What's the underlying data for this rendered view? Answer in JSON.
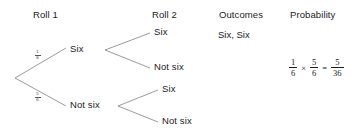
{
  "diagram": {
    "type": "probability-tree",
    "title_row": {
      "roll1": "Roll 1",
      "roll2": "Roll 2",
      "outcomes": "Outcomes",
      "probability": "Probability"
    },
    "roll1_branches": [
      {
        "label": "Six",
        "probability_numerator": "1",
        "probability_denominator": "6"
      },
      {
        "label": "Not six",
        "probability_numerator": "5",
        "probability_denominator": "6"
      }
    ],
    "roll2_branches": [
      {
        "label": "Six"
      },
      {
        "label": "Not six"
      },
      {
        "label": "Six"
      },
      {
        "label": "Not six"
      }
    ],
    "outcomes": [
      {
        "label": "Six, Six"
      }
    ],
    "probability_expression": {
      "factor1": {
        "numerator": "1",
        "denominator": "6"
      },
      "times": "×",
      "factor2": {
        "numerator": "5",
        "denominator": "6"
      },
      "equals": "=",
      "result": {
        "numerator": "5",
        "denominator": "36"
      }
    },
    "colors": {
      "background": "#ffffff",
      "text": "#1b1b1b",
      "line": "#6e6e6e"
    }
  }
}
